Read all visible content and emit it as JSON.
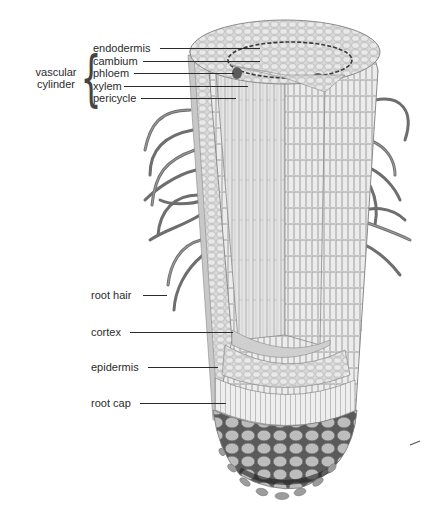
{
  "diagram": {
    "group": {
      "label_line1": "vascular",
      "label_line2": "cylinder"
    },
    "labels": [
      {
        "id": "endodermis",
        "text": "endodermis"
      },
      {
        "id": "cambium",
        "text": "cambium"
      },
      {
        "id": "phloem",
        "text": "phloem"
      },
      {
        "id": "xylem",
        "text": "xylem"
      },
      {
        "id": "pericycle",
        "text": "pericycle"
      },
      {
        "id": "root-hair",
        "text": "root hair"
      },
      {
        "id": "cortex",
        "text": "cortex"
      },
      {
        "id": "epidermis",
        "text": "epidermis"
      },
      {
        "id": "root-cap",
        "text": "root cap"
      }
    ]
  }
}
